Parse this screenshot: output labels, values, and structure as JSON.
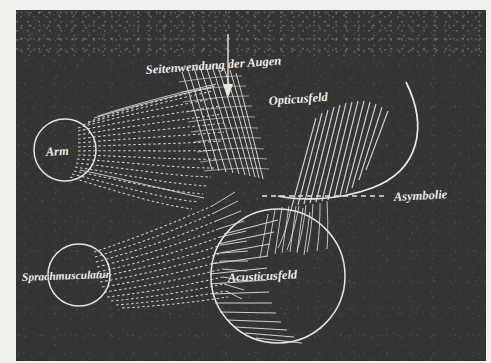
{
  "figure": {
    "kind": "engraved-anatomical-plate",
    "medium_tone": "dark-halftone",
    "colors": {
      "paper": "#f2f0ec",
      "plate_background": "#343434",
      "ink": "#ededea"
    }
  },
  "labels": {
    "seitenwendung": "Seitenwendung der Augen",
    "opticusfeld": "Opticusfeld",
    "arm": "Arm",
    "asymbolie": "Asymbolie",
    "sprachmusculatur": "Sprachmusculatur",
    "acusticusfeld": "Acusticusfeld"
  },
  "elements": {
    "arrow": "down-arrow-to-seitenwendung-bundle",
    "asymbolie_leader": "dashed-leader-line",
    "opticus_arc": "large-sweeping-arc",
    "arm_node": "circle-node",
    "sprach_node": "circle-node",
    "acusticus_node": "large-circle-field"
  }
}
